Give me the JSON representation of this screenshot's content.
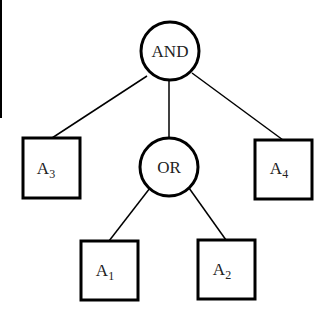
{
  "diagram": {
    "type": "and-or tree",
    "root": {
      "id": "and",
      "label": "AND",
      "shape": "circle"
    },
    "nodes": [
      {
        "id": "and",
        "label": "AND",
        "shape": "circle"
      },
      {
        "id": "or",
        "label": "OR",
        "shape": "circle"
      },
      {
        "id": "a3",
        "label": "A",
        "subscript": "3",
        "shape": "square"
      },
      {
        "id": "a4",
        "label": "A",
        "subscript": "4",
        "shape": "square"
      },
      {
        "id": "a1",
        "label": "A",
        "subscript": "1",
        "shape": "square"
      },
      {
        "id": "a2",
        "label": "A",
        "subscript": "2",
        "shape": "square"
      }
    ],
    "edges": [
      {
        "from": "and",
        "to": "a3"
      },
      {
        "from": "and",
        "to": "or"
      },
      {
        "from": "and",
        "to": "a4"
      },
      {
        "from": "or",
        "to": "a1"
      },
      {
        "from": "or",
        "to": "a2"
      }
    ],
    "colors": {
      "stroke": "#000000",
      "background": "#ffffff",
      "text": "#222222"
    }
  }
}
